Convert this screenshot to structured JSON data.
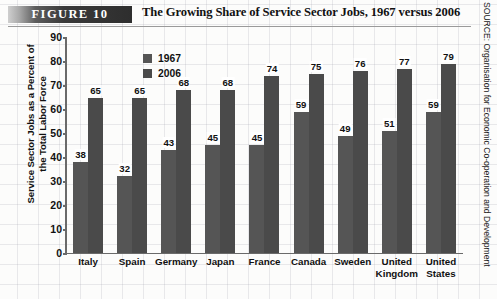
{
  "header": {
    "figure_badge": "FIGURE  10",
    "title": "The Growing Share of Service Sector Jobs, 1967 versus 2006"
  },
  "source": "SOURCE: Organisation for Economic Co-operation and Development",
  "chart_data": {
    "type": "bar",
    "title": "The Growing Share of Service Sector Jobs, 1967 versus 2006",
    "xlabel": "",
    "ylabel": "Service Sector Jobs as a Percent of the Total Labor Force",
    "ylim": [
      0,
      90
    ],
    "yticks": [
      "90",
      "80",
      "70",
      "60",
      "50",
      "40",
      "30",
      "20",
      "10",
      "0"
    ],
    "grid": false,
    "legend_position": "top-left",
    "categories": [
      "Italy",
      "Spain",
      "Germany",
      "Japan",
      "France",
      "Canada",
      "Sweden",
      "United Kingdom",
      "United States"
    ],
    "series": [
      {
        "name": "1967",
        "color": "#555555",
        "values": [
          38,
          32,
          43,
          45,
          45,
          59,
          49,
          51,
          59
        ]
      },
      {
        "name": "2006",
        "color": "#4a4a4a",
        "values": [
          65,
          65,
          68,
          68,
          74,
          75,
          76,
          77,
          79
        ]
      }
    ]
  }
}
